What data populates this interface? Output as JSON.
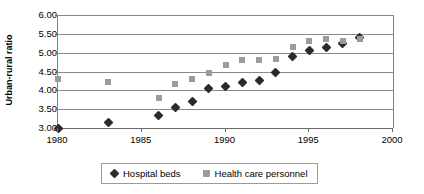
{
  "chart_data": {
    "type": "scatter",
    "title": "",
    "xlabel": "",
    "ylabel": "Urban-rural ratio",
    "xlim": [
      1980,
      2000
    ],
    "ylim": [
      3.0,
      6.0
    ],
    "grid": true,
    "legend_position": "bottom",
    "x_ticks": [
      "1980",
      "1985",
      "1990",
      "1995",
      "2000"
    ],
    "x_tick_values": [
      1980,
      1985,
      1990,
      1995,
      2000
    ],
    "y_ticks": [
      "3.00",
      "3.50",
      "4.00",
      "4.50",
      "5.00",
      "5.50",
      "6.00"
    ],
    "y_tick_values": [
      3.0,
      3.5,
      4.0,
      4.5,
      5.0,
      5.5,
      6.0
    ],
    "series": [
      {
        "name": "Hospital beds",
        "marker": "diamond",
        "color": "#2b2b2b",
        "x": [
          1980,
          1983,
          1986,
          1987,
          1988,
          1989,
          1990,
          1991,
          1992,
          1993,
          1994,
          1995,
          1996,
          1997,
          1998
        ],
        "values": [
          3.0,
          3.15,
          3.33,
          3.55,
          3.7,
          4.05,
          4.1,
          4.22,
          4.25,
          4.47,
          4.9,
          5.05,
          5.15,
          5.25,
          5.4
        ]
      },
      {
        "name": "Health care personnel",
        "marker": "square",
        "color": "#9c9c9c",
        "x": [
          1980,
          1983,
          1986,
          1987,
          1988,
          1989,
          1990,
          1991,
          1992,
          1993,
          1994,
          1995,
          1996,
          1997,
          1998
        ],
        "values": [
          4.3,
          4.22,
          3.8,
          4.17,
          4.3,
          4.45,
          4.67,
          4.8,
          4.8,
          4.83,
          5.15,
          5.3,
          5.35,
          5.3,
          5.35
        ]
      }
    ]
  },
  "legend": {
    "entries": [
      {
        "label": "Hospital beds",
        "marker": "diamond"
      },
      {
        "label": "Health care personnel",
        "marker": "square"
      }
    ]
  }
}
